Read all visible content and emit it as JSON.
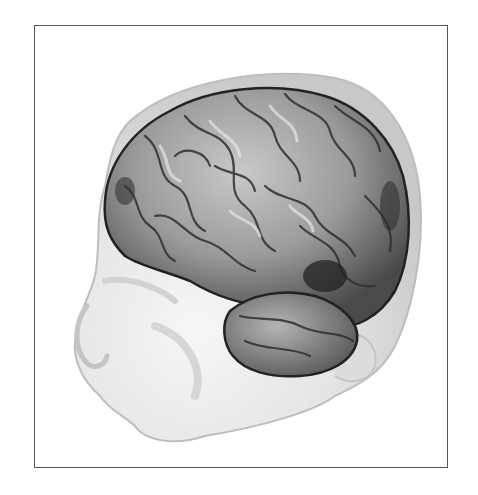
{
  "figure": {
    "colors": {
      "frame_border": "#555555",
      "head_skin": "#e6e6e6",
      "head_outline_shell": "#cfcfcf",
      "brain_base": "#8a8a8a",
      "brain_highlight": "#d8d8d8",
      "brain_shadow": "#2a2a2a"
    }
  }
}
